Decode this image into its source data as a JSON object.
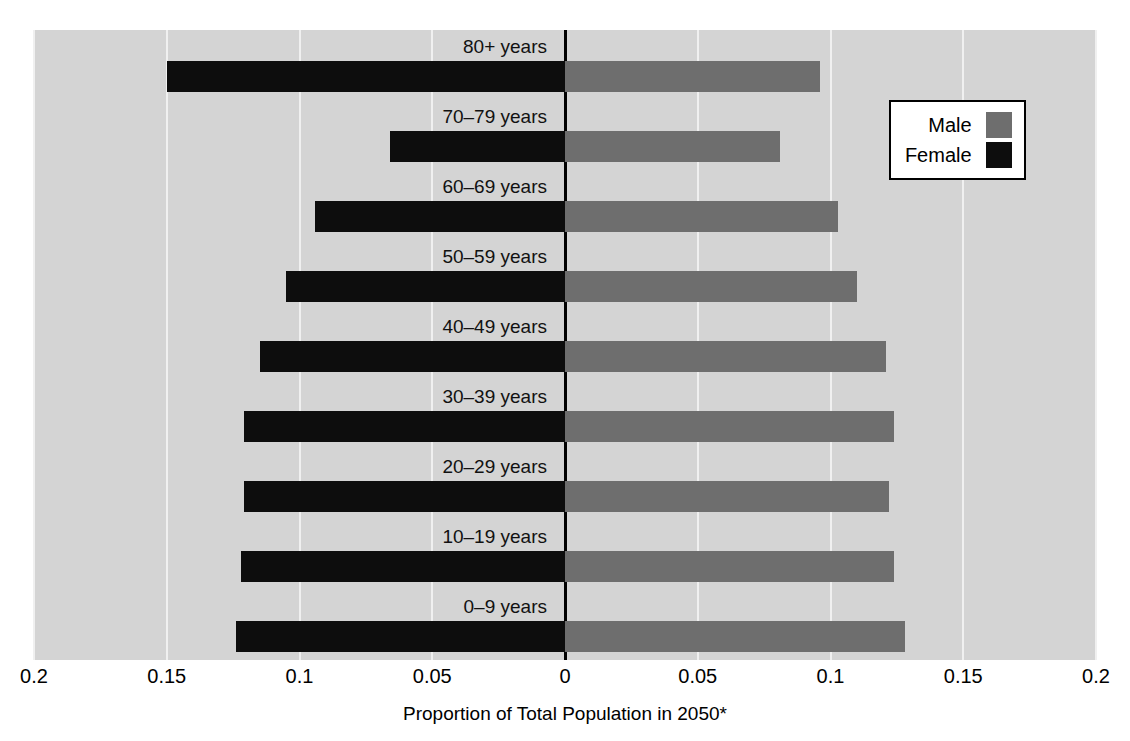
{
  "chart_data": {
    "type": "bar",
    "subtype": "population-pyramid",
    "title": "",
    "xlabel": "Proportion of Total Population in 2050*",
    "ylabel": "",
    "orientation": "horizontal",
    "diverging": true,
    "categories": [
      "80+ years",
      "70–79 years",
      "60–69 years",
      "50–59 years",
      "40–49 years",
      "30–39 years",
      "20–29 years",
      "10–19 years",
      "0–9 years"
    ],
    "series": [
      {
        "name": "Male",
        "color": "#6e6e6e",
        "direction": "right",
        "values": [
          0.096,
          0.081,
          0.103,
          0.11,
          0.121,
          0.124,
          0.122,
          0.124,
          0.128
        ]
      },
      {
        "name": "Female",
        "color": "#0d0d0d",
        "direction": "left",
        "values": [
          0.15,
          0.066,
          0.094,
          0.105,
          0.115,
          0.121,
          0.121,
          0.122,
          0.124
        ]
      }
    ],
    "xlim": [
      -0.2,
      0.2
    ],
    "xticks": [
      -0.2,
      -0.15,
      -0.1,
      -0.05,
      0,
      0.05,
      0.1,
      0.15,
      0.2
    ],
    "xticklabels": [
      "0.2",
      "0.15",
      "0.1",
      "0.05",
      "0",
      "0.05",
      "0.1",
      "0.15",
      "0.2"
    ],
    "grid": true,
    "gridline_color": "#f0f0f0",
    "panel_color": "#d4d4d4",
    "legend_position": "top-right",
    "legend_entries": [
      {
        "label": "Male",
        "color": "#6e6e6e"
      },
      {
        "label": "Female",
        "color": "#0d0d0d"
      }
    ]
  }
}
